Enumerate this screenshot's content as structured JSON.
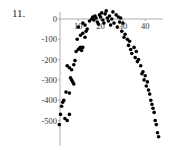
{
  "problem_number": "11.",
  "chart_data": {
    "type": "scatter",
    "title": "",
    "xlabel": "",
    "ylabel": "",
    "xlim": [
      0,
      48
    ],
    "ylim": [
      -600,
      40
    ],
    "x_ticks": [
      10,
      20,
      30,
      40
    ],
    "x_tick_labels": [
      "10",
      "20",
      "30",
      "40"
    ],
    "y_ticks": [
      0,
      -100,
      -200,
      -300,
      -400,
      -500
    ],
    "y_tick_labels": [
      "0",
      "-100",
      "-200",
      "-300",
      "-400",
      "-500"
    ],
    "grid": false,
    "legend": null,
    "axis_color": "#999999",
    "point_color": "#000000",
    "series": [
      {
        "name": "data",
        "points": [
          [
            1.5,
            -520
          ],
          [
            2,
            -470
          ],
          [
            2.5,
            -430
          ],
          [
            3,
            -410
          ],
          [
            3.5,
            -400
          ],
          [
            4,
            -490
          ],
          [
            5,
            -500
          ],
          [
            6,
            -470
          ],
          [
            4.5,
            -360
          ],
          [
            6,
            -365
          ],
          [
            6.5,
            -290
          ],
          [
            7,
            -300
          ],
          [
            7.5,
            -310
          ],
          [
            8,
            -320
          ],
          [
            5,
            -230
          ],
          [
            6,
            -240
          ],
          [
            7,
            -250
          ],
          [
            8,
            -225
          ],
          [
            8.5,
            -205
          ],
          [
            9,
            -160
          ],
          [
            10,
            -150
          ],
          [
            10.5,
            -145
          ],
          [
            11,
            -140
          ],
          [
            11.5,
            -155
          ],
          [
            12,
            -140
          ],
          [
            9.5,
            -100
          ],
          [
            11,
            -80
          ],
          [
            12,
            -70
          ],
          [
            13,
            -90
          ],
          [
            13.5,
            -60
          ],
          [
            10,
            -40
          ],
          [
            12,
            -20
          ],
          [
            13,
            -30
          ],
          [
            14,
            -50
          ],
          [
            15,
            -10
          ],
          [
            16,
            0
          ],
          [
            16.5,
            10
          ],
          [
            17,
            -5
          ],
          [
            17.5,
            15
          ],
          [
            18,
            5
          ],
          [
            18.5,
            -15
          ],
          [
            19,
            -25
          ],
          [
            19.5,
            20
          ],
          [
            20,
            10
          ],
          [
            20.5,
            30
          ],
          [
            21,
            -5
          ],
          [
            21.5,
            -20
          ],
          [
            22,
            25
          ],
          [
            22.5,
            40
          ],
          [
            23,
            5
          ],
          [
            23.5,
            -10
          ],
          [
            24,
            15
          ],
          [
            24.5,
            -30
          ],
          [
            25,
            0
          ],
          [
            25.5,
            35
          ],
          [
            26,
            -20
          ],
          [
            27,
            20
          ],
          [
            27.5,
            -40
          ],
          [
            28,
            10
          ],
          [
            28.5,
            -15
          ],
          [
            29,
            5
          ],
          [
            29.5,
            -60
          ],
          [
            30,
            -20
          ],
          [
            30.5,
            -90
          ],
          [
            31,
            -75
          ],
          [
            32,
            -100
          ],
          [
            32.5,
            -130
          ],
          [
            33,
            -110
          ],
          [
            33.5,
            -150
          ],
          [
            34,
            -170
          ],
          [
            35,
            -140
          ],
          [
            35.5,
            -190
          ],
          [
            36,
            -160
          ],
          [
            36.5,
            -210
          ],
          [
            37,
            -200
          ],
          [
            38,
            -230
          ],
          [
            38.5,
            -270
          ],
          [
            39,
            -260
          ],
          [
            39.5,
            -300
          ],
          [
            40,
            -280
          ],
          [
            40.5,
            -330
          ],
          [
            41,
            -310
          ],
          [
            41.5,
            -350
          ],
          [
            42,
            -370
          ],
          [
            42.5,
            -400
          ],
          [
            43,
            -420
          ],
          [
            43.5,
            -440
          ],
          [
            44,
            -460
          ],
          [
            44.5,
            -500
          ],
          [
            45,
            -520
          ],
          [
            45.5,
            -560
          ],
          [
            46,
            -580
          ]
        ]
      }
    ]
  }
}
